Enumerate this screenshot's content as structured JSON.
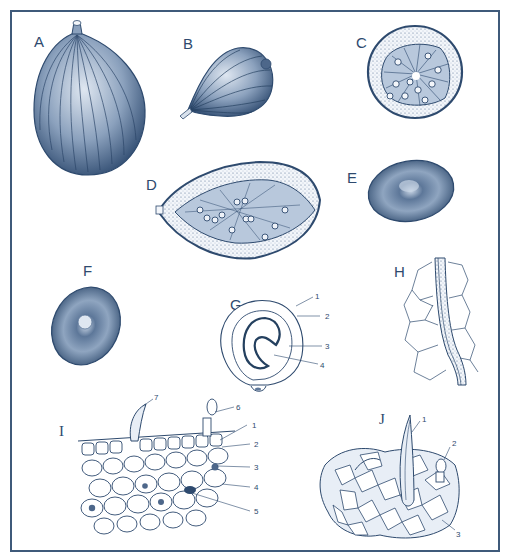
{
  "plate": {
    "description": "Botanical plate: fruit and seed morphology with tissue anatomy",
    "colors": {
      "ink": "#2e4a6e",
      "ink_dark": "#24405f",
      "fill_light": "#e8eef6",
      "frame": "#3f5a7a",
      "background": "#ffffff"
    },
    "panels": [
      {
        "id": "A",
        "label": "A",
        "subject": "whole fruit, ribbed, ovoid"
      },
      {
        "id": "B",
        "label": "B",
        "subject": "fruit, side view with stalk"
      },
      {
        "id": "C",
        "label": "C",
        "subject": "transverse section of fruit"
      },
      {
        "id": "D",
        "label": "D",
        "subject": "longitudinal section of fruit"
      },
      {
        "id": "E",
        "label": "E",
        "subject": "seed"
      },
      {
        "id": "F",
        "label": "F",
        "subject": "seed, face view"
      },
      {
        "id": "G",
        "label": "G",
        "subject": "seed section",
        "callouts": [
          "1",
          "2",
          "3",
          "4"
        ]
      },
      {
        "id": "H",
        "label": "H",
        "subject": "vascular strand in tissue"
      },
      {
        "id": "I",
        "label": "I",
        "subject": "tissue cross section with hairs",
        "callouts": [
          "1",
          "2",
          "3",
          "4",
          "5",
          "6",
          "7"
        ]
      },
      {
        "id": "J",
        "label": "J",
        "subject": "epidermis surface view with hairs",
        "callouts": [
          "1",
          "2",
          "3"
        ]
      }
    ]
  }
}
